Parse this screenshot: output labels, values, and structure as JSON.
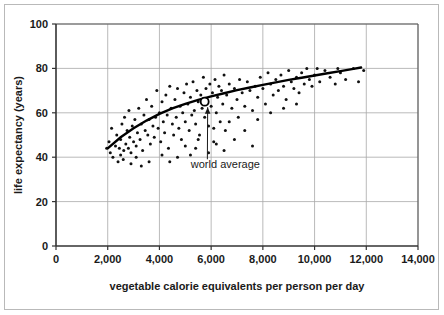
{
  "chart_data": {
    "type": "scatter",
    "title": "",
    "xlabel": "vegetable calorie equivalents per person per day",
    "ylabel": "life expectancy (years)",
    "xlim": [
      0,
      14000
    ],
    "ylim": [
      0,
      100
    ],
    "xticks": [
      0,
      2000,
      4000,
      6000,
      8000,
      10000,
      12000,
      14000
    ],
    "xticklabels": [
      "0",
      "2,000",
      "4,000",
      "6,000",
      "8,000",
      "10,000",
      "12,000",
      "14,000"
    ],
    "yticks": [
      0,
      20,
      40,
      60,
      80,
      100
    ],
    "yticklabels": [
      "0",
      "20",
      "40",
      "60",
      "80",
      "100"
    ],
    "grid": true,
    "legend": null,
    "point_color": "#111111",
    "curve_color": "#000000",
    "grid_color": "#a8a8a8",
    "axis_color": "#333333",
    "annotations": [
      {
        "text": "world average",
        "text_x": 6550,
        "text_y": 35,
        "point_x": 5750,
        "point_y": 65,
        "marker": "open-circle"
      }
    ],
    "series": [
      {
        "name": "countries",
        "points": [
          [
            1960,
            44
          ],
          [
            2050,
            47
          ],
          [
            2100,
            42
          ],
          [
            2150,
            53
          ],
          [
            2200,
            40
          ],
          [
            2300,
            45
          ],
          [
            2350,
            50
          ],
          [
            2400,
            38
          ],
          [
            2450,
            44
          ],
          [
            2500,
            41
          ],
          [
            2500,
            48
          ],
          [
            2550,
            55
          ],
          [
            2600,
            39
          ],
          [
            2620,
            43
          ],
          [
            2650,
            58
          ],
          [
            2700,
            46
          ],
          [
            2750,
            52
          ],
          [
            2800,
            44
          ],
          [
            2820,
            61
          ],
          [
            2850,
            49
          ],
          [
            2900,
            42
          ],
          [
            2950,
            54
          ],
          [
            3000,
            47
          ],
          [
            3050,
            57
          ],
          [
            3100,
            45
          ],
          [
            3150,
            51
          ],
          [
            3200,
            62
          ],
          [
            3250,
            48
          ],
          [
            3300,
            55
          ],
          [
            3350,
            43
          ],
          [
            3400,
            59
          ],
          [
            3450,
            52
          ],
          [
            3500,
            66
          ],
          [
            3550,
            50
          ],
          [
            3600,
            57
          ],
          [
            3650,
            46
          ],
          [
            3700,
            63
          ],
          [
            3750,
            54
          ],
          [
            3800,
            49
          ],
          [
            3850,
            58
          ],
          [
            3900,
            70
          ],
          [
            3950,
            53
          ],
          [
            4000,
            60
          ],
          [
            4050,
            47
          ],
          [
            4100,
            65
          ],
          [
            4150,
            56
          ],
          [
            4200,
            51
          ],
          [
            4250,
            68
          ],
          [
            4300,
            59
          ],
          [
            4350,
            44
          ],
          [
            4400,
            72
          ],
          [
            4450,
            62
          ],
          [
            4500,
            55
          ],
          [
            4550,
            50
          ],
          [
            4600,
            66
          ],
          [
            4650,
            58
          ],
          [
            4700,
            71
          ],
          [
            4750,
            53
          ],
          [
            4800,
            63
          ],
          [
            4850,
            48
          ],
          [
            4900,
            60
          ],
          [
            4950,
            69
          ],
          [
            5000,
            56
          ],
          [
            5050,
            73
          ],
          [
            5100,
            64
          ],
          [
            5150,
            52
          ],
          [
            5200,
            67
          ],
          [
            5250,
            59
          ],
          [
            5300,
            74
          ],
          [
            5350,
            61
          ],
          [
            5400,
            55
          ],
          [
            5450,
            70
          ],
          [
            5500,
            65
          ],
          [
            5550,
            50
          ],
          [
            5600,
            68
          ],
          [
            5650,
            62
          ],
          [
            5700,
            76
          ],
          [
            5750,
            58
          ],
          [
            5800,
            71
          ],
          [
            5850,
            66
          ],
          [
            5900,
            54
          ],
          [
            5950,
            73
          ],
          [
            6000,
            63
          ],
          [
            6050,
            69
          ],
          [
            6100,
            47
          ],
          [
            6150,
            75
          ],
          [
            6200,
            60
          ],
          [
            6250,
            67
          ],
          [
            6300,
            72
          ],
          [
            6350,
            56
          ],
          [
            6400,
            70
          ],
          [
            6450,
            64
          ],
          [
            6500,
            77
          ],
          [
            6550,
            52
          ],
          [
            6600,
            68
          ],
          [
            6700,
            73
          ],
          [
            6800,
            62
          ],
          [
            6900,
            71
          ],
          [
            7000,
            66
          ],
          [
            7050,
            58
          ],
          [
            7100,
            75
          ],
          [
            7200,
            69
          ],
          [
            7300,
            63
          ],
          [
            7400,
            74
          ],
          [
            7500,
            70
          ],
          [
            7600,
            45
          ],
          [
            7700,
            72
          ],
          [
            7800,
            67
          ],
          [
            7900,
            76
          ],
          [
            8000,
            71
          ],
          [
            8100,
            64
          ],
          [
            8200,
            78
          ],
          [
            8300,
            73
          ],
          [
            8400,
            68
          ],
          [
            8500,
            75
          ],
          [
            8600,
            70
          ],
          [
            8700,
            77
          ],
          [
            8800,
            72
          ],
          [
            8900,
            66
          ],
          [
            9000,
            79
          ],
          [
            9100,
            74
          ],
          [
            9200,
            71
          ],
          [
            9300,
            76
          ],
          [
            9400,
            69
          ],
          [
            9500,
            78
          ],
          [
            9600,
            73
          ],
          [
            9700,
            80
          ],
          [
            9800,
            75
          ],
          [
            9900,
            72
          ],
          [
            10000,
            77
          ],
          [
            10200,
            74
          ],
          [
            10400,
            79
          ],
          [
            10600,
            76
          ],
          [
            10800,
            73
          ],
          [
            11000,
            78
          ],
          [
            11200,
            75
          ],
          [
            11500,
            80
          ],
          [
            11700,
            74
          ],
          [
            11900,
            79
          ],
          [
            5200,
            41
          ],
          [
            5400,
            44
          ],
          [
            5900,
            42
          ],
          [
            6200,
            46
          ],
          [
            6500,
            43
          ],
          [
            6900,
            48
          ],
          [
            7300,
            52
          ],
          [
            5000,
            45
          ],
          [
            4700,
            40
          ],
          [
            4400,
            38
          ],
          [
            3300,
            36
          ],
          [
            3100,
            40
          ],
          [
            2900,
            37
          ],
          [
            3600,
            38
          ],
          [
            4100,
            41
          ],
          [
            7800,
            57
          ],
          [
            8300,
            60
          ],
          [
            8800,
            62
          ],
          [
            9300,
            64
          ],
          [
            7600,
            61
          ],
          [
            6700,
            56
          ],
          [
            6100,
            53
          ],
          [
            5500,
            48
          ],
          [
            10100,
            80
          ],
          [
            10900,
            80
          ]
        ]
      }
    ],
    "trend": {
      "name": "fitted curve",
      "points": [
        [
          2000,
          44
        ],
        [
          2500,
          49
        ],
        [
          3000,
          53
        ],
        [
          3500,
          56.5
        ],
        [
          4000,
          59.5
        ],
        [
          4500,
          62
        ],
        [
          5000,
          64
        ],
        [
          5500,
          65.8
        ],
        [
          6000,
          67.4
        ],
        [
          6500,
          68.8
        ],
        [
          7000,
          70.2
        ],
        [
          7500,
          71.4
        ],
        [
          8000,
          72.6
        ],
        [
          8500,
          73.7
        ],
        [
          9000,
          74.8
        ],
        [
          9500,
          75.8
        ],
        [
          10000,
          76.8
        ],
        [
          10500,
          77.8
        ],
        [
          11000,
          78.8
        ],
        [
          11500,
          79.8
        ],
        [
          11800,
          80.4
        ]
      ]
    }
  }
}
